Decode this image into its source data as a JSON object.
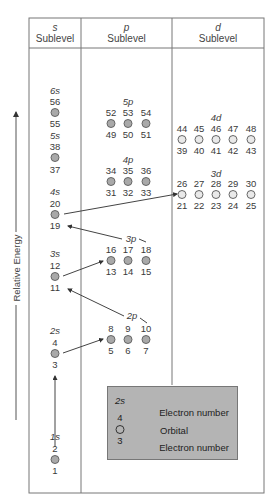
{
  "headers": [
    {
      "symbol": "s",
      "label": "Sublevel"
    },
    {
      "symbol": "p",
      "label": "Sublevel"
    },
    {
      "symbol": "d",
      "label": "Sublevel"
    }
  ],
  "axis": {
    "label": "Relative Energy"
  },
  "s_sublevels": [
    {
      "name": "6s",
      "top": "56",
      "bottom": "55"
    },
    {
      "name": "5s",
      "top": "38",
      "bottom": "37"
    },
    {
      "name": "4s",
      "top": "20",
      "bottom": "19"
    },
    {
      "name": "3s",
      "top": "12",
      "bottom": "11"
    },
    {
      "name": "2s",
      "top": "4",
      "bottom": "3"
    },
    {
      "name": "1s",
      "top": "2",
      "bottom": "1"
    }
  ],
  "p_sublevels": [
    {
      "name": "5p",
      "top": [
        "52",
        "53",
        "54"
      ],
      "bottom": [
        "49",
        "50",
        "51"
      ]
    },
    {
      "name": "4p",
      "top": [
        "34",
        "35",
        "36"
      ],
      "bottom": [
        "31",
        "32",
        "33"
      ]
    },
    {
      "name": "3p",
      "top": [
        "16",
        "17",
        "18"
      ],
      "bottom": [
        "13",
        "14",
        "15"
      ]
    },
    {
      "name": "2p",
      "top": [
        "8",
        "9",
        "10"
      ],
      "bottom": [
        "5",
        "6",
        "7"
      ]
    }
  ],
  "d_sublevels": [
    {
      "name": "4d",
      "top": [
        "44",
        "45",
        "46",
        "47",
        "48"
      ],
      "bottom": [
        "39",
        "40",
        "41",
        "42",
        "43"
      ]
    },
    {
      "name": "3d",
      "top": [
        "26",
        "27",
        "28",
        "29",
        "30"
      ],
      "bottom": [
        "21",
        "22",
        "23",
        "24",
        "25"
      ]
    }
  ],
  "legend": {
    "title": "2s",
    "top_number": "4",
    "bottom_number": "3",
    "top_label": "Electron number",
    "orbital_label": "Orbital",
    "bottom_label": "Electron number"
  },
  "colors": {
    "filled_orbital": "#a9a9a9",
    "empty_orbital": "#e9e9e9",
    "legend_bg": "#b4b4b4",
    "lines": "#555555"
  }
}
